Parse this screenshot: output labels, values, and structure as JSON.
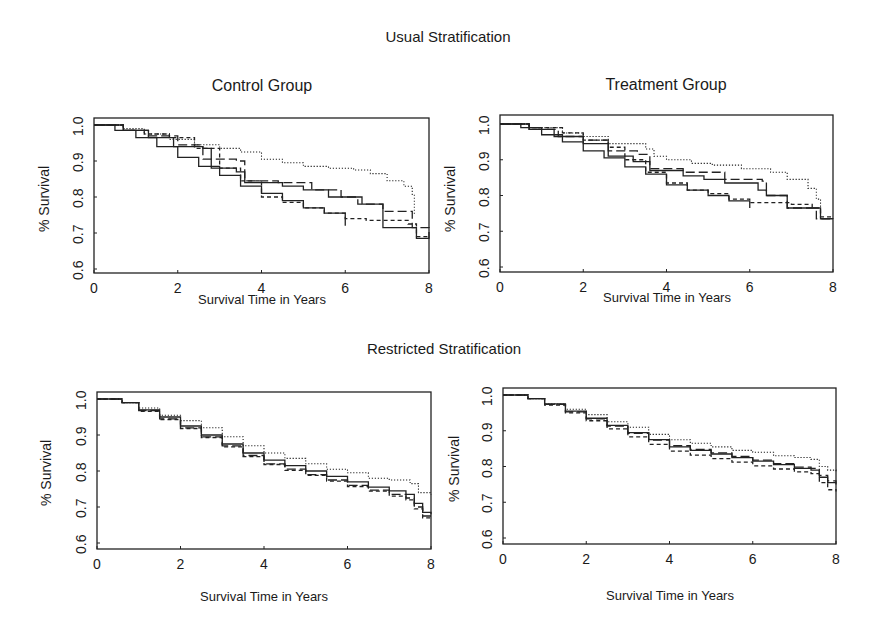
{
  "figure": {
    "top_section_title": "Usual Stratification",
    "bottom_section_title": "Restricted Stratification"
  },
  "panels": [
    {
      "id": "usual-control",
      "title": "Control Group",
      "xlabel": "Survival Time in Years",
      "ylabel": "% Survival",
      "box": {
        "left": 94,
        "right": 429,
        "top": 118,
        "bottom": 273
      },
      "ypix": {
        "y1": 125,
        "y06": 269
      }
    },
    {
      "id": "usual-treatment",
      "title": "Treatment Group",
      "xlabel": "Survival Time in Years",
      "ylabel": "% Survival",
      "box": {
        "left": 500,
        "right": 833,
        "top": 115,
        "bottom": 272
      },
      "ypix": {
        "y1": 124,
        "y06": 267
      }
    },
    {
      "id": "restricted-control",
      "title": "",
      "xlabel": "Survival Time in Years",
      "ylabel": "% Survival",
      "box": {
        "left": 97,
        "right": 431,
        "top": 392,
        "bottom": 549
      },
      "ypix": {
        "y1": 399,
        "y06": 543
      }
    },
    {
      "id": "restricted-treatment",
      "title": "",
      "xlabel": "Survival Time in Years",
      "ylabel": "% Survival",
      "box": {
        "left": 503,
        "right": 836,
        "top": 388,
        "bottom": 544
      },
      "ypix": {
        "y1": 395,
        "y06": 538
      }
    }
  ],
  "axes": {
    "x_ticks": [
      "0",
      "2",
      "4",
      "6",
      "8"
    ],
    "y_ticks": [
      "0.6",
      "0.7",
      "0.8",
      "0.9",
      "1.0"
    ]
  },
  "chart_data": [
    {
      "type": "line",
      "title": "Usual Stratification — Control Group",
      "xlabel": "Survival Time in Years",
      "ylabel": "% Survival",
      "xlim": [
        0,
        8
      ],
      "ylim": [
        0.6,
        1.0
      ],
      "x_ticks": [
        0,
        2,
        4,
        6,
        8
      ],
      "y_ticks": [
        0.6,
        0.7,
        0.8,
        0.9,
        1.0
      ],
      "grid": false,
      "legend": null,
      "series": [
        {
          "name": "stratum-dotted",
          "style": "dotted",
          "x": [
            0,
            0.7,
            1.2,
            1.8,
            2.4,
            3.0,
            3.5,
            4.0,
            4.5,
            5.0,
            5.6,
            6.2,
            6.6,
            7.0,
            7.4,
            7.6,
            7.65
          ],
          "y": [
            1.0,
            0.99,
            0.975,
            0.96,
            0.945,
            0.935,
            0.925,
            0.905,
            0.895,
            0.885,
            0.88,
            0.875,
            0.865,
            0.845,
            0.83,
            0.805,
            0.75
          ]
        },
        {
          "name": "stratum-longdash",
          "style": "longdash",
          "x": [
            0,
            0.7,
            1.3,
            2.0,
            2.6,
            3.4,
            3.6,
            4.4,
            5.2,
            5.9,
            6.3,
            6.9,
            7.6,
            8.0
          ],
          "y": [
            1.0,
            0.985,
            0.97,
            0.945,
            0.905,
            0.9,
            0.845,
            0.84,
            0.82,
            0.8,
            0.78,
            0.76,
            0.715,
            0.685
          ]
        },
        {
          "name": "stratum-solid-a",
          "style": "solid",
          "x": [
            0,
            0.7,
            1.3,
            1.9,
            2.6,
            2.8,
            3.4,
            3.6,
            4.5,
            5.0,
            5.6,
            6.3,
            6.4,
            6.9,
            7.6,
            7.7,
            8.0
          ],
          "y": [
            1.0,
            0.985,
            0.965,
            0.94,
            0.935,
            0.88,
            0.87,
            0.84,
            0.83,
            0.82,
            0.8,
            0.8,
            0.78,
            0.715,
            0.715,
            0.685,
            0.685
          ]
        },
        {
          "name": "stratum-solid-b",
          "style": "solid",
          "x": [
            0,
            0.5,
            1.0,
            1.5,
            2.0,
            2.5,
            3.0,
            3.5,
            4.0,
            4.5,
            5.0,
            5.5,
            6.0
          ],
          "y": [
            1.0,
            0.985,
            0.965,
            0.94,
            0.91,
            0.885,
            0.86,
            0.83,
            0.81,
            0.79,
            0.77,
            0.755,
            0.72
          ]
        },
        {
          "name": "stratum-shortdash",
          "style": "dashed",
          "x": [
            0,
            0.7,
            1.2,
            1.8,
            2.4,
            3.0,
            3.5,
            4.0,
            4.5,
            5.0,
            5.5,
            6.0,
            6.5,
            7.0,
            7.5,
            7.7,
            8.0
          ],
          "y": [
            1.0,
            0.985,
            0.975,
            0.965,
            0.935,
            0.88,
            0.845,
            0.8,
            0.785,
            0.77,
            0.755,
            0.74,
            0.735,
            0.735,
            0.725,
            0.69,
            0.685
          ]
        }
      ]
    },
    {
      "type": "line",
      "title": "Usual Stratification — Treatment Group",
      "xlabel": "Survival Time in Years",
      "ylabel": "% Survival",
      "xlim": [
        0,
        8
      ],
      "ylim": [
        0.6,
        1.0
      ],
      "x_ticks": [
        0,
        2,
        4,
        6,
        8
      ],
      "y_ticks": [
        0.6,
        0.7,
        0.8,
        0.9,
        1.0
      ],
      "grid": false,
      "legend": null,
      "series": [
        {
          "name": "stratum-dotted",
          "style": "dotted",
          "x": [
            0,
            0.7,
            1.5,
            2.0,
            2.6,
            3.5,
            3.7,
            4.0,
            4.6,
            5.1,
            5.8,
            6.5,
            6.9,
            7.4,
            7.6,
            7.7
          ],
          "y": [
            1.0,
            0.99,
            0.975,
            0.965,
            0.945,
            0.93,
            0.91,
            0.9,
            0.89,
            0.885,
            0.875,
            0.865,
            0.845,
            0.82,
            0.79,
            0.75
          ]
        },
        {
          "name": "stratum-longdash",
          "style": "longdash",
          "x": [
            0,
            0.7,
            1.4,
            2.0,
            2.6,
            3.3,
            3.6,
            4.4,
            5.4,
            6.3,
            6.4,
            6.9,
            7.6,
            8.0
          ],
          "y": [
            1.0,
            0.985,
            0.965,
            0.955,
            0.925,
            0.915,
            0.875,
            0.865,
            0.845,
            0.84,
            0.8,
            0.765,
            0.735,
            0.735
          ]
        },
        {
          "name": "stratum-solid-a",
          "style": "solid",
          "x": [
            0,
            0.7,
            1.3,
            2.0,
            2.6,
            3.2,
            3.6,
            4.4,
            4.9,
            5.4,
            6.2,
            6.4,
            6.9,
            7.6,
            7.7,
            8.0
          ],
          "y": [
            1.0,
            0.985,
            0.965,
            0.945,
            0.91,
            0.895,
            0.87,
            0.855,
            0.845,
            0.835,
            0.815,
            0.8,
            0.765,
            0.765,
            0.735,
            0.735
          ]
        },
        {
          "name": "stratum-solid-b",
          "style": "solid",
          "x": [
            0,
            0.5,
            1.0,
            1.5,
            2.0,
            2.5,
            3.0,
            3.5,
            4.0,
            4.5,
            5.0,
            5.5,
            6.0
          ],
          "y": [
            1.0,
            0.99,
            0.97,
            0.95,
            0.925,
            0.905,
            0.88,
            0.86,
            0.83,
            0.815,
            0.8,
            0.785,
            0.765
          ]
        },
        {
          "name": "stratum-shortdash",
          "style": "dashed",
          "x": [
            0,
            0.7,
            1.5,
            2.0,
            2.6,
            3.0,
            3.5,
            4.0,
            4.5,
            5.0,
            5.5,
            6.0,
            6.5,
            7.0,
            7.5,
            7.7,
            8.0
          ],
          "y": [
            1.0,
            0.99,
            0.975,
            0.955,
            0.935,
            0.9,
            0.865,
            0.835,
            0.815,
            0.805,
            0.79,
            0.78,
            0.78,
            0.775,
            0.765,
            0.74,
            0.735
          ]
        }
      ]
    },
    {
      "type": "line",
      "title": "Restricted Stratification — Control Group",
      "xlabel": "Survival Time in Years",
      "ylabel": "% Survival",
      "xlim": [
        0,
        8
      ],
      "ylim": [
        0.6,
        1.0
      ],
      "x_ticks": [
        0,
        2,
        4,
        6,
        8
      ],
      "y_ticks": [
        0.6,
        0.7,
        0.8,
        0.9,
        1.0
      ],
      "grid": false,
      "legend": null,
      "series": [
        {
          "name": "stratum-dotted",
          "style": "dotted",
          "x": [
            0,
            0.6,
            1.0,
            1.5,
            2.0,
            2.5,
            3.0,
            3.5,
            4.0,
            4.5,
            5.0,
            5.5,
            6.0,
            6.5,
            7.0,
            7.5,
            7.7,
            8.0
          ],
          "y": [
            1.0,
            0.99,
            0.975,
            0.955,
            0.94,
            0.92,
            0.895,
            0.87,
            0.85,
            0.835,
            0.82,
            0.805,
            0.795,
            0.78,
            0.775,
            0.765,
            0.74,
            0.735
          ]
        },
        {
          "name": "stratum-solid",
          "style": "solid",
          "x": [
            0,
            0.6,
            1.0,
            1.5,
            2.0,
            2.5,
            3.0,
            3.5,
            4.0,
            4.5,
            5.0,
            5.5,
            6.0,
            6.5,
            7.0,
            7.4,
            7.6,
            7.8,
            8.0
          ],
          "y": [
            1.0,
            0.99,
            0.97,
            0.95,
            0.925,
            0.9,
            0.875,
            0.85,
            0.83,
            0.815,
            0.8,
            0.785,
            0.77,
            0.755,
            0.745,
            0.735,
            0.71,
            0.685,
            0.68
          ]
        },
        {
          "name": "stratum-longdash",
          "style": "longdash",
          "x": [
            0,
            0.6,
            1.0,
            1.5,
            2.0,
            2.5,
            3.0,
            3.5,
            4.0,
            4.5,
            5.0,
            5.5,
            6.0,
            6.5,
            7.0,
            7.4,
            7.6,
            7.8,
            8.0
          ],
          "y": [
            1.0,
            0.99,
            0.968,
            0.945,
            0.92,
            0.895,
            0.87,
            0.843,
            0.82,
            0.805,
            0.79,
            0.775,
            0.76,
            0.747,
            0.735,
            0.725,
            0.7,
            0.675,
            0.67
          ]
        },
        {
          "name": "stratum-shortdash",
          "style": "dashed",
          "x": [
            0,
            0.6,
            1.0,
            1.5,
            2.0,
            2.5,
            3.0,
            3.5,
            4.0,
            4.5,
            5.0,
            5.5,
            6.0,
            6.5,
            7.0,
            7.4,
            7.6,
            7.8,
            8.0
          ],
          "y": [
            1.0,
            0.99,
            0.966,
            0.943,
            0.918,
            0.893,
            0.867,
            0.84,
            0.818,
            0.802,
            0.788,
            0.772,
            0.757,
            0.744,
            0.73,
            0.72,
            0.695,
            0.67,
            0.665
          ]
        }
      ]
    },
    {
      "type": "line",
      "title": "Restricted Stratification — Treatment Group",
      "xlabel": "Survival Time in Years",
      "ylabel": "% Survival",
      "xlim": [
        0,
        8
      ],
      "ylim": [
        0.6,
        1.0
      ],
      "x_ticks": [
        0,
        2,
        4,
        6,
        8
      ],
      "y_ticks": [
        0.6,
        0.7,
        0.8,
        0.9,
        1.0
      ],
      "grid": false,
      "legend": null,
      "series": [
        {
          "name": "stratum-dotted",
          "style": "dotted",
          "x": [
            0,
            0.6,
            1.0,
            1.5,
            2.0,
            2.5,
            3.0,
            3.5,
            4.0,
            4.5,
            5.0,
            5.5,
            6.0,
            6.5,
            7.0,
            7.4,
            7.6,
            7.8,
            8.0
          ],
          "y": [
            1.0,
            0.99,
            0.975,
            0.96,
            0.945,
            0.925,
            0.91,
            0.89,
            0.875,
            0.865,
            0.855,
            0.845,
            0.84,
            0.83,
            0.825,
            0.82,
            0.8,
            0.79,
            0.785
          ]
        },
        {
          "name": "stratum-solid",
          "style": "solid",
          "x": [
            0,
            0.6,
            1.0,
            1.5,
            2.0,
            2.5,
            3.0,
            3.5,
            4.0,
            4.5,
            5.0,
            5.5,
            6.0,
            6.5,
            7.0,
            7.4,
            7.6,
            7.8,
            8.0
          ],
          "y": [
            1.0,
            0.99,
            0.975,
            0.955,
            0.935,
            0.915,
            0.895,
            0.875,
            0.855,
            0.845,
            0.835,
            0.825,
            0.815,
            0.805,
            0.795,
            0.79,
            0.77,
            0.755,
            0.75
          ]
        },
        {
          "name": "stratum-longdash",
          "style": "longdash",
          "x": [
            0,
            0.6,
            1.0,
            1.5,
            2.0,
            2.5,
            3.0,
            3.5,
            4.0,
            4.5,
            5.0,
            5.5,
            6.0,
            6.5,
            7.0,
            7.4,
            7.6,
            7.8,
            8.0
          ],
          "y": [
            1.0,
            0.99,
            0.974,
            0.953,
            0.933,
            0.913,
            0.893,
            0.874,
            0.858,
            0.848,
            0.838,
            0.828,
            0.818,
            0.808,
            0.798,
            0.795,
            0.775,
            0.76,
            0.755
          ]
        },
        {
          "name": "stratum-shortdash",
          "style": "dashed",
          "x": [
            0,
            0.6,
            1.0,
            1.5,
            2.0,
            2.5,
            3.0,
            3.5,
            4.0,
            4.5,
            5.0,
            5.5,
            6.0,
            6.5,
            7.0,
            7.4,
            7.6,
            7.8,
            8.0
          ],
          "y": [
            1.0,
            0.99,
            0.972,
            0.95,
            0.928,
            0.905,
            0.883,
            0.862,
            0.843,
            0.832,
            0.822,
            0.812,
            0.802,
            0.793,
            0.785,
            0.78,
            0.755,
            0.735,
            0.73
          ]
        }
      ]
    }
  ]
}
